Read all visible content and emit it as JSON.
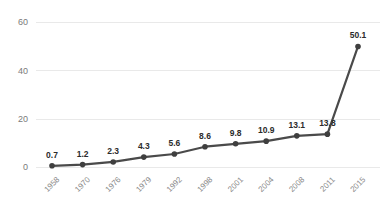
{
  "chart_data": {
    "type": "line",
    "title": "",
    "subtitle": "",
    "xlabel": "",
    "ylabel": "",
    "categories": [
      "1958",
      "1970",
      "1976",
      "1979",
      "1992",
      "1998",
      "2001",
      "2004",
      "2008",
      "2011",
      "2015"
    ],
    "values": [
      0.7,
      1.2,
      2.3,
      4.3,
      5.6,
      8.6,
      9.8,
      10.9,
      13.1,
      13.8,
      50.1
    ],
    "point_labels": [
      "0.7",
      "1.2",
      "2.3",
      "4.3",
      "5.6",
      "8.6",
      "9.8",
      "10.9",
      "13.1",
      "13.8",
      "50.1"
    ],
    "ylim": [
      0,
      60
    ],
    "y_ticks": [
      0,
      20,
      40,
      60
    ],
    "y_tick_labels": [
      "0",
      "20",
      "40",
      "60"
    ],
    "grid": true,
    "grid_axis": "y",
    "legend": false,
    "legend_position": "none",
    "series": [
      {
        "name": "",
        "values": [
          0.7,
          1.2,
          2.3,
          4.3,
          5.6,
          8.6,
          9.8,
          10.9,
          13.1,
          13.8,
          50.1
        ],
        "color": "#4a4a4a",
        "marker": "circle"
      }
    ],
    "colors": {
      "line": "#4a4a4a",
      "marker": "#3f3f3f",
      "grid": "#e9e9e9",
      "y_tick_text": "#7a7a7a",
      "x_tick_text": "#8a8a8a",
      "data_label_text": "#2b2b2b",
      "background": "#ffffff"
    },
    "x_tick_rotation_degrees": -45
  }
}
